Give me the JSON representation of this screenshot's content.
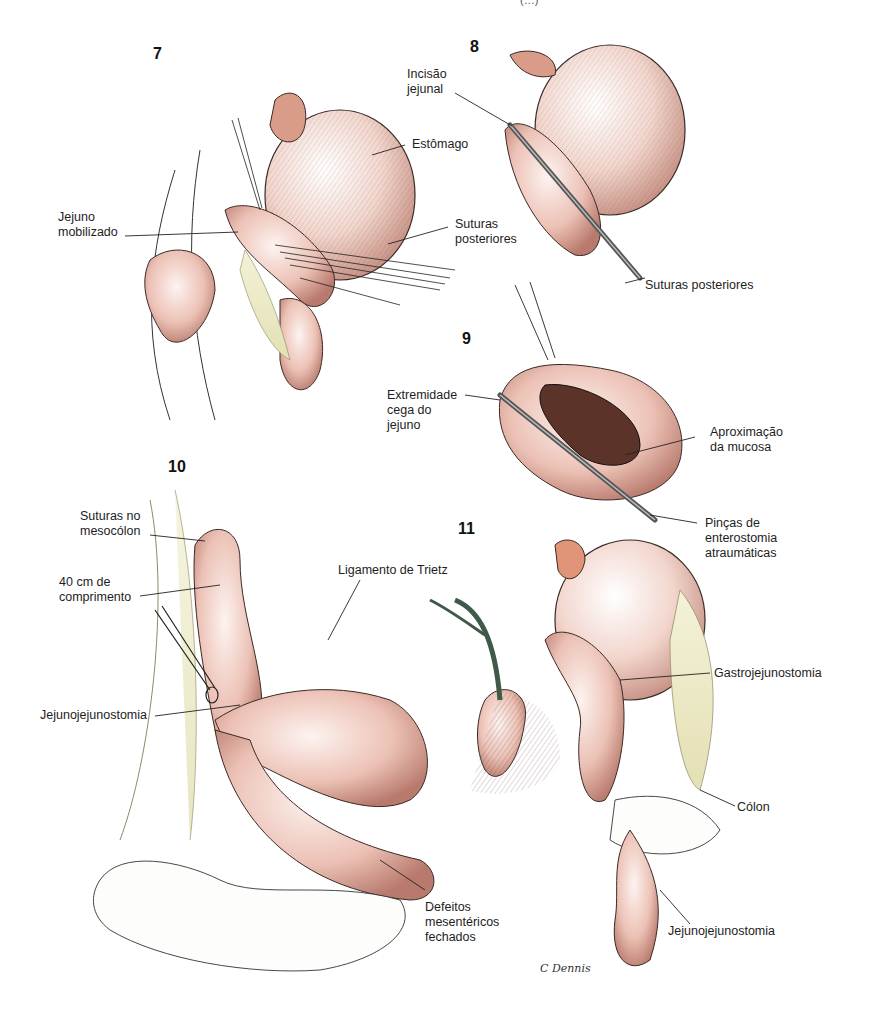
{
  "header_clip": "(…) ",
  "figures": [
    {
      "number": "7",
      "labels": [
        "Estômago",
        "Jejuno\nmobilizado",
        "Suturas\nposteriores"
      ]
    },
    {
      "number": "8",
      "labels": [
        "Incisão\njejunal",
        "Suturas posteriores"
      ]
    },
    {
      "number": "9",
      "labels": [
        "Extremidade\ncega do\njejuno",
        "Aproximação\nda mucosa",
        "Pinças de\nenterostomia\natraumáticas"
      ]
    },
    {
      "number": "10",
      "labels": [
        "Suturas no\nmesocólon",
        "40 cm de\ncomprimento",
        "Ligamento de Trietz",
        "Jejunojejunostomia",
        "Defeitos\nmesentéricos\nfechados"
      ]
    },
    {
      "number": "11",
      "labels": [
        "Gastrojejunostomia",
        "Cólon",
        "Jejunojejunostomia"
      ]
    }
  ],
  "signature": "C Dennis",
  "colors": {
    "tissue_pink": "#e8b9ad",
    "tissue_dark": "#b07468",
    "mesentery_yellow": "#eeeccb",
    "vessel_green": "#3f5a48",
    "line": "#1a1a1a"
  }
}
